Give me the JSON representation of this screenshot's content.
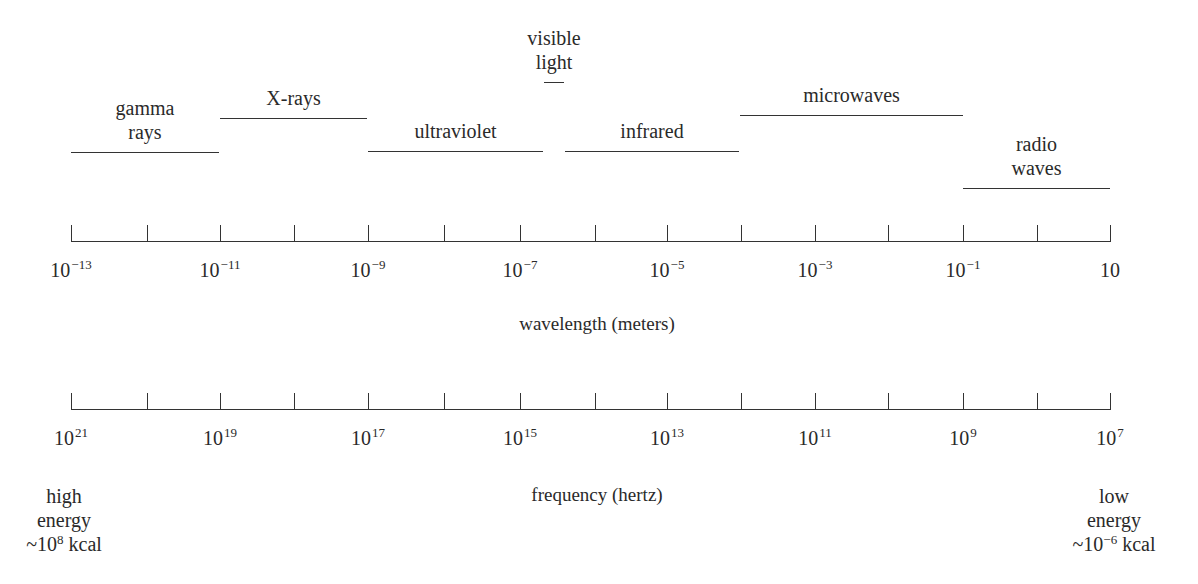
{
  "diagram": {
    "bands": [
      {
        "name": "gamma rays",
        "lines": [
          "gamma",
          "rays"
        ],
        "x_start": 71,
        "x_end": 219,
        "line_y": 152
      },
      {
        "name": "X-rays",
        "lines": [
          "X-rays"
        ],
        "x_start": 220,
        "x_end": 367,
        "line_y": 118
      },
      {
        "name": "ultraviolet",
        "lines": [
          "ultraviolet"
        ],
        "x_start": 368,
        "x_end": 543,
        "line_y": 151
      },
      {
        "name": "visible light",
        "lines": [
          "visible",
          "light"
        ],
        "x_start": 543,
        "x_end": 565,
        "line_y": 82
      },
      {
        "name": "infrared",
        "lines": [
          "infrared"
        ],
        "x_start": 565,
        "x_end": 739,
        "line_y": 151
      },
      {
        "name": "microwaves",
        "lines": [
          "microwaves"
        ],
        "x_start": 740,
        "x_end": 963,
        "line_y": 115
      },
      {
        "name": "radio waves",
        "lines": [
          "radio",
          "waves"
        ],
        "x_start": 963,
        "x_end": 1110,
        "line_y": 188
      }
    ],
    "wavelength_axis": {
      "title": "wavelength (meters)",
      "tick_x": [
        71,
        147,
        220,
        294,
        368,
        444,
        520,
        595,
        667,
        741,
        815,
        888,
        963,
        1037,
        1110
      ],
      "labels": [
        {
          "base": "10",
          "exp": "−13",
          "x": 71
        },
        {
          "base": "10",
          "exp": "−11",
          "x": 220
        },
        {
          "base": "10",
          "exp": "−9",
          "x": 368
        },
        {
          "base": "10",
          "exp": "−7",
          "x": 520
        },
        {
          "base": "10",
          "exp": "−5",
          "x": 667
        },
        {
          "base": "10",
          "exp": "−3",
          "x": 815
        },
        {
          "base": "10",
          "exp": "−1",
          "x": 963
        },
        {
          "base": "10",
          "exp": "",
          "x": 1110
        }
      ]
    },
    "frequency_axis": {
      "title": "frequency (hertz)",
      "tick_x": [
        71,
        147,
        220,
        294,
        368,
        444,
        520,
        595,
        667,
        741,
        815,
        888,
        963,
        1037,
        1110
      ],
      "labels": [
        {
          "base": "10",
          "exp": "21",
          "x": 71
        },
        {
          "base": "10",
          "exp": "19",
          "x": 220
        },
        {
          "base": "10",
          "exp": "17",
          "x": 368
        },
        {
          "base": "10",
          "exp": "15",
          "x": 520
        },
        {
          "base": "10",
          "exp": "13",
          "x": 667
        },
        {
          "base": "10",
          "exp": "11",
          "x": 815
        },
        {
          "base": "10",
          "exp": "9",
          "x": 963
        },
        {
          "base": "10",
          "exp": "7",
          "x": 1110
        }
      ]
    },
    "energy_left": {
      "line1": "high",
      "line2": "energy",
      "prefix": "~10",
      "exp": "8",
      "suffix": " kcal"
    },
    "energy_right": {
      "line1": "low",
      "line2": "energy",
      "prefix": "~10",
      "exp": "−6",
      "suffix": " kcal"
    }
  }
}
